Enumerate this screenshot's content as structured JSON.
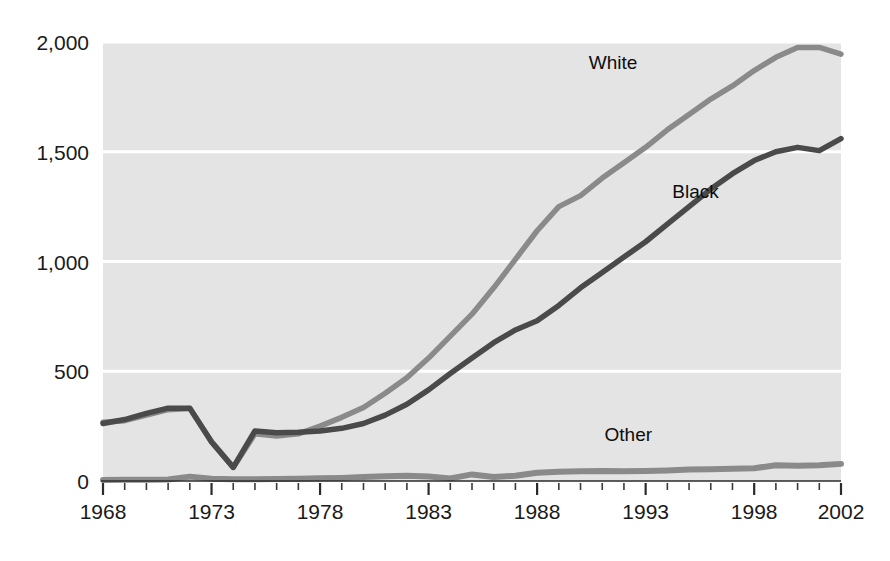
{
  "chart_data": {
    "type": "line",
    "title": "",
    "subtitle": "",
    "xlabel": "",
    "ylabel": "",
    "xlim": [
      1968,
      2002
    ],
    "ylim": [
      0,
      2000
    ],
    "yticks": [
      0,
      500,
      1000,
      1500,
      2000
    ],
    "ytick_labels": [
      "0",
      "500",
      "1,000",
      "1,500",
      "2,000"
    ],
    "xticks": [
      1968,
      1973,
      1978,
      1983,
      1988,
      1993,
      1998,
      2002
    ],
    "xtick_labels": [
      "1968",
      "1973",
      "1978",
      "1983",
      "1988",
      "1993",
      "1998",
      "2002"
    ],
    "x_minor_tick_step": 1,
    "grid": "horizontal-white",
    "legend_position": "inline-annotations",
    "x": [
      1968,
      1969,
      1970,
      1971,
      1972,
      1973,
      1974,
      1975,
      1976,
      1977,
      1978,
      1979,
      1980,
      1981,
      1982,
      1983,
      1984,
      1985,
      1986,
      1987,
      1988,
      1989,
      1990,
      1991,
      1992,
      1993,
      1994,
      1995,
      1996,
      1997,
      1998,
      1999,
      2000,
      2001,
      2002
    ],
    "series": [
      {
        "name": "White",
        "color": "#8a8a8a",
        "label": "White",
        "label_x": 1991.5,
        "label_y": 1875,
        "values": [
          268,
          275,
          300,
          325,
          330,
          180,
          62,
          215,
          205,
          215,
          250,
          290,
          335,
          400,
          470,
          560,
          660,
          760,
          880,
          1010,
          1140,
          1250,
          1300,
          1380,
          1450,
          1520,
          1600,
          1670,
          1740,
          1800,
          1870,
          1930,
          1975,
          1975,
          1945
        ]
      },
      {
        "name": "Black",
        "color": "#4a4a4a",
        "label": "Black",
        "label_x": 1995.3,
        "label_y": 1290,
        "values": [
          262,
          280,
          308,
          332,
          332,
          178,
          62,
          228,
          220,
          222,
          228,
          240,
          262,
          300,
          350,
          415,
          490,
          560,
          630,
          688,
          730,
          800,
          880,
          950,
          1020,
          1090,
          1170,
          1250,
          1330,
          1400,
          1460,
          1500,
          1520,
          1505,
          1560
        ]
      },
      {
        "name": "Other",
        "color": "#8a8a8a",
        "label": "Other",
        "label_x": 1992.2,
        "label_y": 180,
        "values": [
          5,
          6,
          6,
          7,
          20,
          10,
          8,
          8,
          9,
          10,
          12,
          14,
          18,
          22,
          24,
          20,
          12,
          30,
          18,
          24,
          38,
          42,
          44,
          46,
          44,
          46,
          48,
          52,
          54,
          56,
          58,
          72,
          70,
          72,
          78
        ]
      }
    ]
  },
  "layout": {
    "plot_left": 103,
    "plot_right": 841,
    "plot_top": 42,
    "plot_bottom": 481
  }
}
